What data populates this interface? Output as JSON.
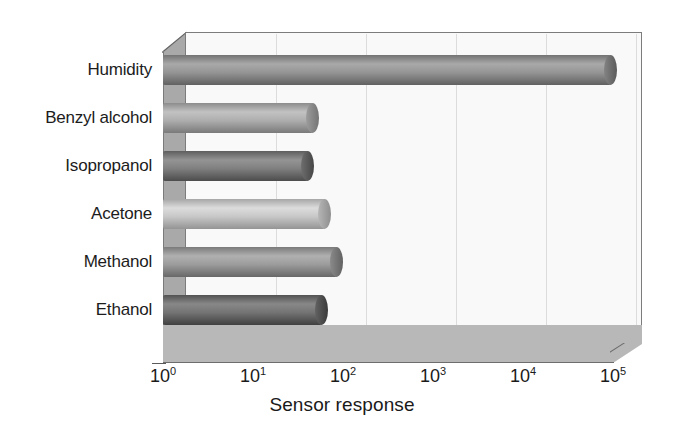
{
  "chart_data": {
    "type": "bar",
    "orientation": "horizontal",
    "title": "",
    "xlabel": "Sensor response",
    "ylabel": "",
    "xscale": "log",
    "xlim": [
      1,
      100000
    ],
    "grid": true,
    "legend": null,
    "categories": [
      "Ethanol",
      "Methanol",
      "Acetone",
      "Isopropanol",
      "Benzyl alcohol",
      "Humidity"
    ],
    "values": [
      58,
      86,
      63,
      41,
      47,
      95000
    ],
    "xtick_labels": [
      "10",
      "10",
      "10",
      "10",
      "10",
      "10"
    ],
    "xtick_exponents": [
      "0",
      "1",
      "2",
      "3",
      "4",
      "5"
    ],
    "xtick_values": [
      1,
      10,
      100,
      1000,
      10000,
      100000
    ],
    "bars": [
      {
        "category": "Humidity",
        "value": 95000,
        "color": "#8f8f8f"
      },
      {
        "category": "Benzyl alcohol",
        "value": 47,
        "color": "#a8a8a8"
      },
      {
        "category": "Isopropanol",
        "value": 41,
        "color": "#7a7a7a"
      },
      {
        "category": "Acetone",
        "value": 63,
        "color": "#c2c2c2"
      },
      {
        "category": "Methanol",
        "value": 86,
        "color": "#969696"
      },
      {
        "category": "Ethanol",
        "value": 58,
        "color": "#6e6e6e"
      }
    ]
  },
  "style": {
    "plot_background": "#f9f9f9",
    "floor_color": "#b8b8b8",
    "side_wall_color": "#a9a9a9",
    "gridline_color": "#dcdcdc",
    "frame_color": "#7c7c7c",
    "text_color": "#1a1a1a"
  }
}
